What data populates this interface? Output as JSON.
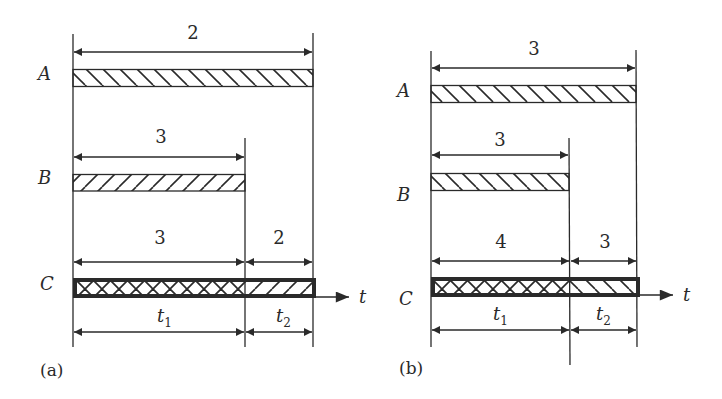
{
  "diagram": {
    "stroke_color": "#2a2a2a",
    "background": "#ffffff",
    "panels": [
      {
        "id": "a",
        "caption": "(a)",
        "rows": [
          {
            "label": "A",
            "duration_label": "2",
            "hatch": "backslash"
          },
          {
            "label": "B",
            "duration_label": "3",
            "hatch": "slash"
          },
          {
            "label": "C",
            "segments": [
              {
                "duration_label": "3",
                "hatch": "crosshatch"
              },
              {
                "duration_label": "2",
                "hatch": "slash"
              }
            ]
          }
        ],
        "time_segments": [
          {
            "label": "t",
            "sub": "1"
          },
          {
            "label": "t",
            "sub": "2"
          }
        ],
        "axis_label": "t"
      },
      {
        "id": "b",
        "caption": "(b)",
        "rows": [
          {
            "label": "A",
            "duration_label": "3",
            "hatch": "backslash"
          },
          {
            "label": "B",
            "duration_label": "3",
            "hatch": "backslash"
          },
          {
            "label": "C",
            "segments": [
              {
                "duration_label": "4",
                "hatch": "crosshatch"
              },
              {
                "duration_label": "3",
                "hatch": "backslash"
              }
            ]
          }
        ],
        "time_segments": [
          {
            "label": "t",
            "sub": "1"
          },
          {
            "label": "t",
            "sub": "2"
          }
        ],
        "axis_label": "t"
      }
    ]
  }
}
